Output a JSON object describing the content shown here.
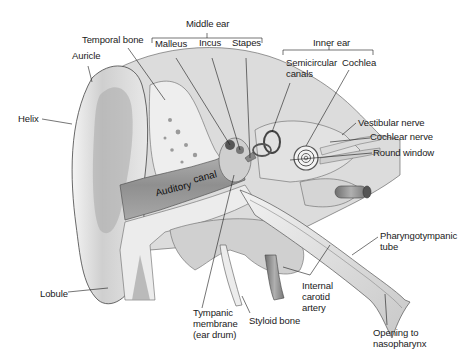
{
  "diagram": {
    "type": "anatomical-illustration",
    "groups": [
      {
        "id": "middle_ear",
        "label": "Middle ear",
        "members": [
          "Malleus",
          "Incus",
          "Stapes"
        ]
      },
      {
        "id": "inner_ear",
        "label": "Inner ear",
        "members": [
          "Semicircular canals",
          "Cochlea"
        ]
      }
    ],
    "labels": {
      "middle_ear": "Middle ear",
      "temporal_bone": "Temporal bone",
      "malleus": "Malleus",
      "incus": "Incus",
      "stapes": "Stapes",
      "inner_ear": "Inner ear",
      "semicircular_canals": "Semicircular\ncanals",
      "cochlea": "Cochlea",
      "auricle": "Auricle",
      "helix": "Helix",
      "vestibular_nerve": "Vestibular nerve",
      "cochlear_nerve": "Cochlear nerve",
      "round_window": "Round window",
      "auditory_canal_1": "Auditory",
      "auditory_canal_2": "canal",
      "pharyngotympanic_tube": "Pharyngotympanic\ntube",
      "lobule": "Lobule",
      "tympanic_membrane": "Tympanic\nmembrane\n(ear drum)",
      "styloid_bone": "Styloid bone",
      "internal_carotid_artery": "Internal\ncarotid\nartery",
      "opening_to_nasopharynx": "Opening to\nnasopharynx"
    },
    "colors": {
      "background": "#ffffff",
      "line": "#1a1a1a",
      "tissue_light": "#e6e6e6",
      "tissue_mid": "#bdbdbd",
      "tissue_dark": "#8a8a8a",
      "canal": "#9a9a9a"
    }
  }
}
